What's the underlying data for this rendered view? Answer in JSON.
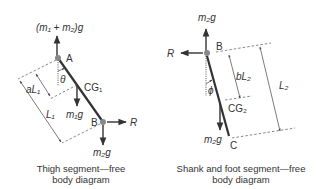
{
  "thigh": {
    "top_force": "(m₁ + m₂)g",
    "joint_top": "A",
    "angle": "θ",
    "dim_short": "aL₁",
    "dim_long": "L₁",
    "cg": "CG₁",
    "weight": "m₁g",
    "joint_bottom": "B",
    "horizontal_force": "R",
    "bottom_force": "m₂g",
    "caption_line1": "Thigh segment—free",
    "caption_line2": "body diagram"
  },
  "shank": {
    "top_force": "m₂g",
    "joint_top": "B",
    "horizontal_force": "R",
    "angle": "ϕ",
    "dim_short": "bL₂",
    "dim_long": "L₂",
    "cg": "CG₂",
    "weight": "m₂g",
    "joint_bottom": "C",
    "caption_line1": "Shank and foot segment—free",
    "caption_line2": "body diagram"
  }
}
